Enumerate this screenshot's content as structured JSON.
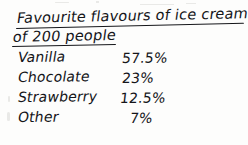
{
  "document": {
    "kind": "handwritten-note",
    "title": {
      "line1": "Favourite flavours of ice cream",
      "line2": "of 200 people"
    },
    "ink_color": "#15161a",
    "paper_color": "#fdfdfc"
  },
  "table": {
    "rows": [
      {
        "flavour": "Vanilla",
        "percent": "57.5%"
      },
      {
        "flavour": "Chocolate",
        "percent": "23%"
      },
      {
        "flavour": "Strawberry",
        "percent": "12.5%"
      },
      {
        "flavour": "Other",
        "percent": "7%"
      }
    ]
  }
}
